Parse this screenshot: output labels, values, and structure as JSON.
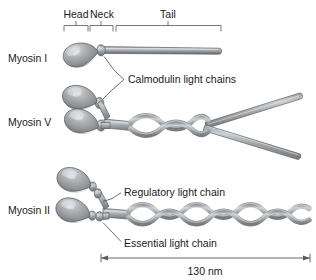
{
  "figure": {
    "background_color": "#ffffff",
    "protein_color": "#9a9ea1",
    "protein_highlight": "#d3d6d8",
    "protein_shadow": "#6f7376",
    "outline_color": "#5e6164",
    "text_color": "#1a1a1a",
    "line_color": "#555555"
  },
  "brackets": [
    {
      "label": "Head",
      "x_start": 64,
      "x_end": 88,
      "tick_x": 76,
      "label_x": 76,
      "label_y": 18
    },
    {
      "label": "Neck",
      "x_start": 90,
      "x_end": 113,
      "tick_x": 101,
      "label_x": 102,
      "label_y": 18
    },
    {
      "label": "Tail",
      "x_start": 116,
      "x_end": 221,
      "tick_x": 168,
      "label_x": 168,
      "label_y": 18
    }
  ],
  "rows": [
    {
      "name": "Myosin I",
      "label": "Myosin I",
      "label_x": 8,
      "label_y": 62,
      "heads": 1,
      "tail_type": "single-straight"
    },
    {
      "name": "Myosin V",
      "label": "Myosin V",
      "label_x": 8,
      "label_y": 126,
      "heads": 2,
      "tail_type": "coiled-coil-split"
    },
    {
      "name": "Myosin II",
      "label": "Myosin II",
      "label_x": 8,
      "label_y": 214,
      "heads": 2,
      "tail_type": "coiled-coil-long"
    }
  ],
  "callouts": [
    {
      "name": "calmodulin-light-chains",
      "label": "Calmodulin light chains",
      "text_x": 128,
      "text_y": 83
    },
    {
      "name": "regulatory-light-chain",
      "label": "Regulatory light chain",
      "text_x": 124,
      "text_y": 196
    },
    {
      "name": "essential-light-chain",
      "label": "Essential light chain",
      "text_x": 124,
      "text_y": 247
    }
  ],
  "scale_bar": {
    "label": "130 nm",
    "value": 130,
    "unit": "nm",
    "x_start": 101,
    "x_end": 310,
    "y": 258,
    "label_x": 205,
    "label_y": 275
  }
}
